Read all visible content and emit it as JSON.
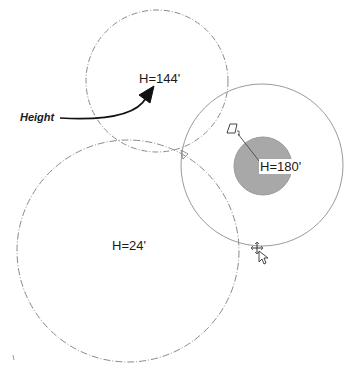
{
  "diagram": {
    "callout": {
      "label": "Height"
    },
    "circles": [
      {
        "id": "circle-top",
        "label": "H=144'",
        "cx": 157,
        "cy": 81,
        "r": 71,
        "style": "dash-dot",
        "stroke": "#8a8a8a"
      },
      {
        "id": "circle-large",
        "label": "H=24'",
        "cx": 128,
        "cy": 251,
        "r": 111,
        "style": "dash-dot",
        "stroke": "#8a8a8a"
      },
      {
        "id": "circle-selected",
        "label": "H=180'",
        "cx": 262,
        "cy": 165,
        "r": 81,
        "style": "solid",
        "stroke": "#9a9a9a"
      }
    ],
    "inner_disc": {
      "cx": 263,
      "cy": 166,
      "r": 29,
      "fill": "#a8a8a8",
      "stroke": "#9a9a9a"
    },
    "colors": {
      "background": "#ffffff",
      "text": "#1a1a1a",
      "arrow": "#111111",
      "disc_fill": "#a8a8a8"
    }
  }
}
